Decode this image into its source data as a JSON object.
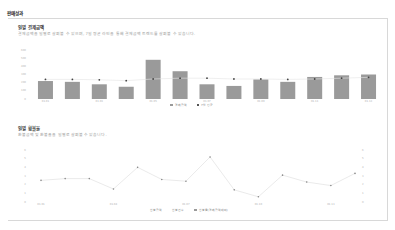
{
  "page": {
    "title": "판매성과"
  },
  "payment_section": {
    "title": "일별 결제금액",
    "description": "결제금액을 일별로 살펴볼 수 있으며, 7일 평균 라인을 통해 결제금액 트렌드를 살펴볼 수 있습니다.",
    "legend": [
      {
        "label": "결제금액",
        "color": "#9a9a9a"
      },
      {
        "label": "7일 평균",
        "color": "#555555"
      }
    ]
  },
  "refund_section": {
    "title": "일별 환불율",
    "description": "환불금액 및 환불율을 일별로 살펴볼 수 있습니다.",
    "legend": [
      {
        "label": "환불금액",
        "color": "#ffffff"
      },
      {
        "label": "환불건수",
        "color": "#ffffff"
      },
      {
        "label": "환불율(결제금액대비)",
        "color": "#9a9a9a"
      }
    ]
  },
  "chart_data": [
    {
      "type": "bar",
      "title": "일별 결제금액",
      "categories": [
        "D1",
        "D2",
        "D3",
        "D4",
        "D5",
        "D6",
        "D7",
        "D8",
        "D9",
        "D10",
        "D11",
        "D12",
        "D13"
      ],
      "x_tick_labels": [
        "01.01",
        "",
        "01.03",
        "",
        "01.05",
        "",
        "01.07",
        "",
        "01.09",
        "",
        "01.11",
        "",
        "01.13"
      ],
      "series": [
        {
          "name": "결제금액",
          "values": [
            220,
            210,
            180,
            150,
            480,
            340,
            180,
            160,
            240,
            210,
            270,
            290,
            300
          ]
        },
        {
          "name": "7일 평균",
          "values": [
            240,
            240,
            235,
            225,
            245,
            255,
            255,
            245,
            245,
            240,
            245,
            255,
            265
          ]
        }
      ],
      "y_ticks": [
        "0",
        "100",
        "200",
        "300",
        "400",
        "500",
        "600"
      ],
      "ylim": [
        0,
        600
      ],
      "grid": false,
      "legend_position": "bottom"
    },
    {
      "type": "line",
      "title": "일별 환불율",
      "categories": [
        "D1",
        "D2",
        "D3",
        "D4",
        "D5",
        "D6",
        "D7",
        "D8",
        "D9",
        "D10",
        "D11",
        "D12",
        "D13",
        "D14"
      ],
      "x_tick_labels": [
        "01.01",
        "",
        "",
        "01.04",
        "",
        "",
        "01.07",
        "",
        "",
        "01.10",
        "",
        "",
        "01.13",
        ""
      ],
      "series": [
        {
          "name": "환불율(결제금액대비)",
          "values": [
            2.5,
            2.7,
            2.7,
            1.5,
            4.0,
            2.6,
            2.4,
            5.2,
            1.4,
            0.6,
            3.1,
            2.3,
            1.9,
            3.3
          ]
        }
      ],
      "y_ticks_left": [
        "0",
        "1",
        "2",
        "3",
        "4",
        "5",
        "6"
      ],
      "y_ticks_right": [
        "0",
        "1",
        "2",
        "3",
        "4",
        "5",
        "6"
      ],
      "ylim": [
        0,
        6
      ],
      "grid": false,
      "legend_position": "bottom"
    }
  ]
}
